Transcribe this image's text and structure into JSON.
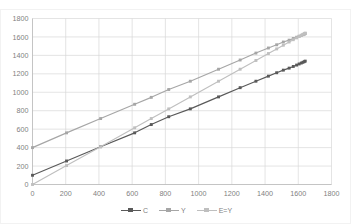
{
  "top_clipped_text": "",
  "chart_data": {
    "type": "line",
    "title": "",
    "subtitle": "",
    "xlabel": "",
    "ylabel": "",
    "xlim": [
      0,
      1800
    ],
    "ylim": [
      0,
      1800
    ],
    "xticks": [
      0,
      200,
      400,
      600,
      800,
      1000,
      1200,
      1400,
      1600,
      1800
    ],
    "yticks": [
      0,
      200,
      400,
      600,
      800,
      1000,
      1200,
      1400,
      1600,
      1800
    ],
    "xtick_labels": [
      "0",
      "200",
      "400",
      "600",
      "800",
      "1000",
      "1200",
      "1400",
      "1600",
      "1800"
    ],
    "ytick_labels": [
      "0",
      "200",
      "400",
      "600",
      "800",
      "1000",
      "1200",
      "1400",
      "1600",
      "1800"
    ],
    "grid": true,
    "grid_axis": "both",
    "grid_color": "#d9d9d9",
    "plot_background": "#ffffff",
    "legend": true,
    "legend_position": "bottom-center",
    "marker": "square",
    "series": [
      {
        "name": "C",
        "color": "#595959",
        "x": [
          0,
          205,
          410,
          615,
          715,
          820,
          950,
          1120,
          1250,
          1345,
          1420,
          1470,
          1510,
          1545,
          1570,
          1590,
          1605,
          1618,
          1628,
          1636,
          1642
        ],
        "y": [
          100,
          255,
          410,
          560,
          650,
          735,
          820,
          950,
          1050,
          1120,
          1175,
          1212,
          1240,
          1262,
          1280,
          1295,
          1307,
          1317,
          1325,
          1332,
          1338
        ]
      },
      {
        "name": "Y",
        "color": "#a6a6a6",
        "x": [
          0,
          205,
          410,
          615,
          715,
          820,
          950,
          1120,
          1250,
          1345,
          1420,
          1470,
          1510,
          1545,
          1570,
          1590,
          1605,
          1618,
          1628,
          1636,
          1642
        ],
        "y": [
          400,
          560,
          715,
          870,
          945,
          1030,
          1120,
          1250,
          1350,
          1425,
          1480,
          1515,
          1545,
          1565,
          1583,
          1597,
          1608,
          1617,
          1624,
          1630,
          1636
        ]
      },
      {
        "name": "E=Y",
        "color": "#bfbfbf",
        "x": [
          0,
          205,
          410,
          615,
          715,
          820,
          950,
          1120,
          1250,
          1345,
          1420,
          1470,
          1510,
          1545,
          1570,
          1590,
          1605,
          1618,
          1628,
          1636,
          1642
        ],
        "y": [
          0,
          205,
          410,
          615,
          715,
          820,
          950,
          1120,
          1250,
          1345,
          1420,
          1470,
          1510,
          1545,
          1570,
          1590,
          1605,
          1618,
          1628,
          1636,
          1642
        ]
      }
    ]
  },
  "legend_entries": [
    {
      "label": "C",
      "color": "#595959"
    },
    {
      "label": "Y",
      "color": "#a6a6a6"
    },
    {
      "label": "E=Y",
      "color": "#bfbfbf"
    }
  ]
}
